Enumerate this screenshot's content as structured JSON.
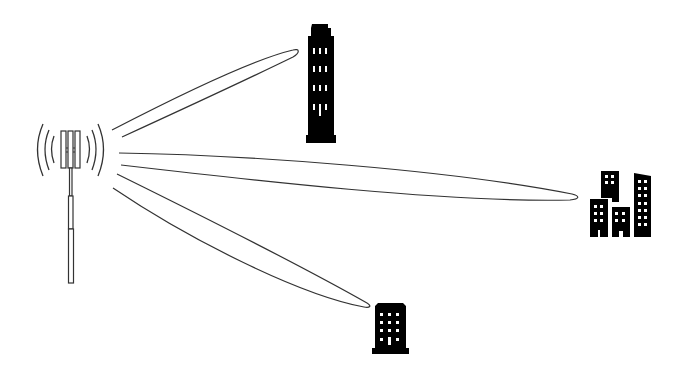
{
  "diagram": {
    "colors": {
      "background": "#ffffff",
      "line": "#333333",
      "fill": "#000000",
      "window": "#ffffff"
    },
    "elements": {
      "tower": "cell-tower-antenna",
      "beams": [
        "beam-to-tall-building",
        "beam-to-building-cluster",
        "beam-to-small-building"
      ],
      "buildings": [
        "tall-building",
        "building-cluster",
        "small-building"
      ]
    }
  }
}
